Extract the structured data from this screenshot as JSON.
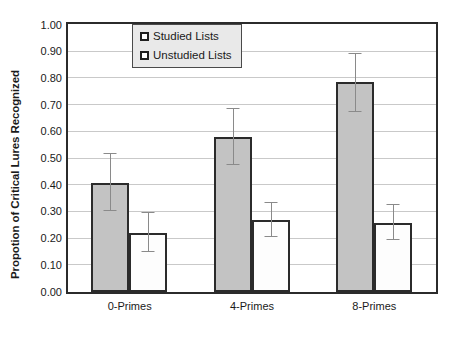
{
  "chart_data": {
    "type": "bar",
    "title": "",
    "xlabel": "",
    "ylabel": "Propotion of Critical Lures Recognized",
    "categories": [
      "0-Primes",
      "4-Primes",
      "8-Primes"
    ],
    "series": [
      {
        "name": "Studied Lists",
        "values": [
          0.41,
          0.58,
          0.785
        ],
        "error_low": [
          0.305,
          0.475,
          0.675
        ],
        "error_high": [
          0.515,
          0.685,
          0.89
        ]
      },
      {
        "name": "Unstudied Lists",
        "values": [
          0.22,
          0.27,
          0.26
        ],
        "error_low": [
          0.15,
          0.205,
          0.195
        ],
        "error_high": [
          0.295,
          0.335,
          0.325
        ]
      }
    ],
    "ylim": [
      0.0,
      1.0
    ],
    "ytick_values": [
      0.0,
      0.1,
      0.2,
      0.3,
      0.4,
      0.5,
      0.6,
      0.7,
      0.8,
      0.9,
      1.0
    ],
    "ytick_labels": [
      "0.00",
      "0.10",
      "0.20",
      "0.30",
      "0.40",
      "0.50",
      "0.60",
      "0.70",
      "0.80",
      "0.90",
      "1.00"
    ],
    "grid": true,
    "legend_position": "upper-left-inside",
    "colors": {
      "studied_fill": "#c3c3c3",
      "unstudied_fill": "#fdfdfd",
      "bar_border": "#2b2b2b",
      "gridline": "#c9c9c9",
      "errorbar": "#8a8a8a",
      "legend_background": "#e9e9e9",
      "text": "#1a1a1a"
    }
  },
  "legend": {
    "items": [
      {
        "label": "Studied Lists"
      },
      {
        "label": "Unstudied Lists"
      }
    ]
  }
}
